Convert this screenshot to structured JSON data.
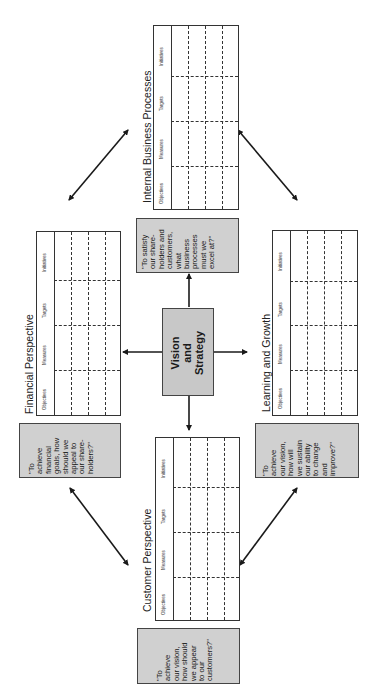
{
  "center": {
    "label": "Vision\nand\nStrategy"
  },
  "columns": [
    "Objectives",
    "Measures",
    "Targets",
    "Initiatives"
  ],
  "perspectives": {
    "internal": {
      "title": "Internal Business Processes",
      "question": "\"To satisfy\nour share-\nholders and\ncustomers,\nwhat\nbusiness\nprocesses\nmust we\nexcel at?\""
    },
    "financial": {
      "title": "Financial Perspective",
      "question": "\"To\nachieve\nfinancial\ngoals, how\nshould we\nappeal to\nour share-\nholders?\""
    },
    "learning": {
      "title": "Learning and Growth",
      "question": "\"To\nachieve\nour vision,\nhow will\nwe sustain\nour ability\nto change\nand\nimprove?\""
    },
    "customer": {
      "title": "Customer Perspective",
      "question": "\"To\nachieve\nour vision,\nhow should\nwe appear\nto our\ncustomers?\""
    }
  },
  "colors": {
    "box_fill": "#d0d0d0",
    "center_fill": "#c8c8c8",
    "line": "#1a1a1a"
  }
}
